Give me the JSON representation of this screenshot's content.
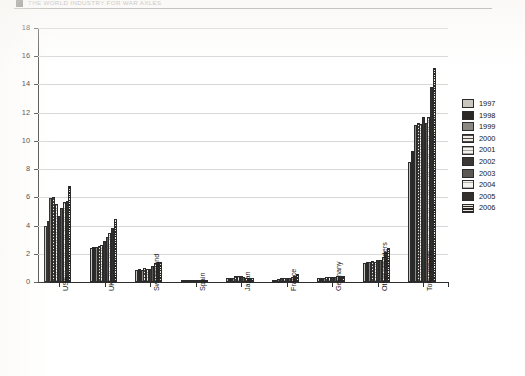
{
  "page_header": {
    "text": "THE WORLD INDUSTRY FOR WAR AXLES",
    "marker_icon": "square-bullet-icon"
  },
  "chart_data": {
    "type": "bar",
    "title": "",
    "subtitle": "",
    "xlabel": "",
    "ylabel": "",
    "ylim": [
      0,
      18
    ],
    "ytick_step": 2,
    "yticks": [
      0,
      2,
      4,
      6,
      8,
      10,
      12,
      14,
      16,
      18
    ],
    "ytick_labels": [
      "0",
      "2",
      "4",
      "6",
      "8",
      "10",
      "12",
      "14",
      "16",
      "18"
    ],
    "grid": true,
    "grid_axis": "y",
    "legend_position": "right",
    "categories": [
      "USA",
      "UK",
      "Switzerland",
      "Spain",
      "Japan",
      "France",
      "Germany",
      "Other reporters",
      "Total imports"
    ],
    "series": [
      {
        "name": "1997",
        "color": "#c9c5bf",
        "pattern": "solid-light",
        "values": [
          4.0,
          2.4,
          0.85,
          0.1,
          0.3,
          0.1,
          0.25,
          1.35,
          8.5
        ]
      },
      {
        "name": "1998",
        "color": "#2a2724",
        "pattern": "solid-dark",
        "values": [
          4.35,
          2.45,
          0.95,
          0.1,
          0.28,
          0.12,
          0.3,
          1.4,
          9.3
        ]
      },
      {
        "name": "1999",
        "color": "#8b8782",
        "pattern": "solid-mid",
        "values": [
          5.95,
          2.45,
          0.85,
          0.1,
          0.25,
          0.2,
          0.3,
          1.45,
          11.1
        ]
      },
      {
        "name": "2000",
        "color": "#4a4744",
        "pattern": "dense-crosshatch",
        "values": [
          6.05,
          2.55,
          1.0,
          0.08,
          0.45,
          0.25,
          0.35,
          1.5,
          11.3
        ]
      },
      {
        "name": "2001",
        "color": "#a6a29c",
        "pattern": "fine-hatch",
        "values": [
          5.55,
          2.6,
          0.95,
          0.08,
          0.45,
          0.25,
          0.35,
          1.45,
          11.2
        ]
      },
      {
        "name": "2002",
        "color": "#3a3734",
        "pattern": "solid-dark",
        "values": [
          4.65,
          2.9,
          0.95,
          0.08,
          0.45,
          0.3,
          0.35,
          1.55,
          11.7
        ]
      },
      {
        "name": "2003",
        "color": "#5c5854",
        "pattern": "solid-mid-dark",
        "values": [
          5.25,
          3.2,
          1.1,
          0.1,
          0.35,
          0.3,
          0.35,
          1.55,
          11.3
        ]
      },
      {
        "name": "2004",
        "color": "#b5b1ab",
        "pattern": "grid-hatch",
        "values": [
          5.65,
          3.5,
          1.35,
          0.1,
          0.3,
          0.35,
          0.4,
          1.8,
          11.7
        ]
      },
      {
        "name": "2005",
        "color": "#332f2c",
        "pattern": "solid-darkest",
        "values": [
          5.75,
          3.8,
          1.4,
          0.12,
          0.3,
          0.45,
          0.45,
          2.15,
          13.8
        ]
      },
      {
        "name": "2006",
        "color": "#262320",
        "pattern": "horizontal-stripe",
        "values": [
          6.8,
          4.5,
          1.45,
          0.12,
          0.3,
          0.55,
          0.45,
          2.4,
          15.2
        ]
      }
    ]
  }
}
